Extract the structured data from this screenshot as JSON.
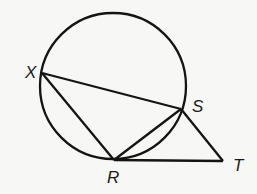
{
  "diagram": {
    "type": "geometry",
    "circle": {
      "cx": 113,
      "cy": 86,
      "r": 73
    },
    "points": {
      "X": {
        "x": 42,
        "y": 73,
        "label": "X",
        "lx": 25,
        "ly": 78
      },
      "S": {
        "x": 181,
        "y": 109,
        "label": "S",
        "lx": 192,
        "ly": 112
      },
      "R": {
        "x": 114,
        "y": 160,
        "label": "R",
        "lx": 107,
        "ly": 183
      },
      "T": {
        "x": 223,
        "y": 161,
        "label": "T",
        "lx": 233,
        "ly": 171
      }
    },
    "segments": [
      [
        "X",
        "S"
      ],
      [
        "X",
        "R"
      ],
      [
        "R",
        "S"
      ],
      [
        "S",
        "T"
      ],
      [
        "R",
        "T"
      ]
    ],
    "stroke_color": "#141414",
    "labels": {
      "X": "X",
      "S": "S",
      "R": "R",
      "T": "T"
    }
  }
}
